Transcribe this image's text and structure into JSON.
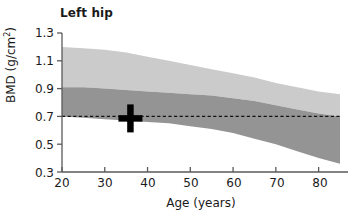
{
  "chart_data": {
    "type": "area",
    "title": "Left hip",
    "xlabel": "Age (years)",
    "ylabel": "BMD (g/cm",
    "ylabel_sup": "2",
    "ylabel_suffix": ")",
    "xlim": [
      20,
      85
    ],
    "ylim": [
      0.3,
      1.3
    ],
    "xticks": [
      20,
      30,
      40,
      50,
      60,
      70,
      80
    ],
    "yticks": [
      "1.3",
      "1.1",
      "0.9",
      "0.7",
      "0.5",
      "0.3"
    ],
    "grid": false,
    "legend": "none",
    "x": [
      20,
      25,
      30,
      35,
      40,
      45,
      50,
      55,
      60,
      65,
      70,
      75,
      80,
      85
    ],
    "series": [
      {
        "name": "outer-band-upper",
        "role": "light_band_top",
        "color": "#cbcbcb",
        "values": [
          1.2,
          1.19,
          1.18,
          1.16,
          1.13,
          1.1,
          1.07,
          1.04,
          1.01,
          0.98,
          0.94,
          0.91,
          0.88,
          0.86
        ]
      },
      {
        "name": "inner-band-upper",
        "role": "dark_band_top",
        "color": "#949494",
        "values": [
          0.91,
          0.91,
          0.9,
          0.89,
          0.88,
          0.87,
          0.86,
          0.85,
          0.83,
          0.81,
          0.78,
          0.75,
          0.72,
          0.7
        ]
      },
      {
        "name": "inner-band-lower",
        "role": "dark_band_bottom",
        "color": "#949494",
        "values": [
          0.7,
          0.69,
          0.68,
          0.67,
          0.66,
          0.65,
          0.63,
          0.61,
          0.58,
          0.54,
          0.5,
          0.45,
          0.4,
          0.36
        ]
      }
    ],
    "reference_line": {
      "name": "threshold-line",
      "orientation": "horizontal",
      "value": 0.7,
      "style": "dashed",
      "color": "#111111"
    },
    "markers": [
      {
        "name": "patient-point",
        "glyph": "cross",
        "x": 36,
        "y": 0.7,
        "color": "#000000"
      }
    ],
    "annotations": [],
    "colors": {
      "light_band": "#cbcbcb",
      "dark_band": "#949494",
      "axis": "#4d4d4d",
      "text": "#1a1a1a",
      "marker": "#000000",
      "background": "#ffffff"
    }
  }
}
